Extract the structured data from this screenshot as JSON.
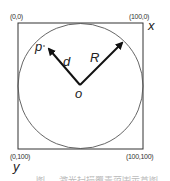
{
  "diagram": {
    "corners": {
      "top_left": "(0,0)",
      "top_right": "(100,0)",
      "bottom_left": "(0,100)",
      "bottom_right": "(100,100)"
    },
    "axes": {
      "x": "x",
      "y": "y"
    },
    "points": {
      "center": "o",
      "point": "p"
    },
    "vectors": {
      "distance": "d",
      "radius": "R"
    },
    "colors": {
      "line": "#222222",
      "circle": "#555555",
      "text": "#333333"
    }
  },
  "caption": {
    "text": "图 … 激光扫描覆盖范围示意图"
  }
}
